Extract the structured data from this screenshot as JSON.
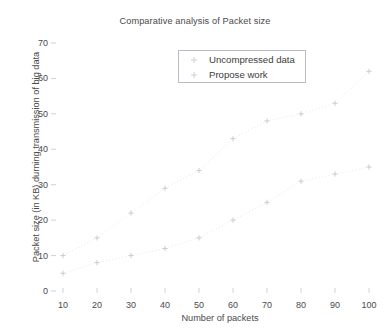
{
  "chart_data": {
    "type": "scatter",
    "title": "Comparative analysis of Packet size",
    "xlabel": "Number of packets",
    "ylabel": "Packet size (in KB) durning transmission of big data",
    "xlim": [
      5,
      104
    ],
    "ylim": [
      0,
      72
    ],
    "xticks": [
      10,
      20,
      30,
      40,
      50,
      60,
      70,
      80,
      90,
      100
    ],
    "yticks": [
      0,
      10,
      20,
      30,
      40,
      50,
      60,
      70
    ],
    "grid": false,
    "legend_position": "upper center",
    "marker": "plus",
    "marker_color": "#c9ccd3",
    "trendline": "dotted",
    "x": [
      10,
      20,
      30,
      40,
      50,
      60,
      70,
      80,
      90,
      100
    ],
    "series": [
      {
        "name": "Uncompressed data",
        "values": [
          10,
          15,
          22,
          29,
          34,
          43,
          48,
          50,
          53,
          62
        ]
      },
      {
        "name": "Propose work",
        "values": [
          5,
          8,
          10,
          12,
          15,
          20,
          25,
          31,
          33,
          35
        ]
      }
    ]
  },
  "axis": {
    "ytick_labels": [
      "70",
      "60",
      "50",
      "40",
      "30",
      "20",
      "10",
      "0"
    ],
    "xtick_labels": [
      "10",
      "20",
      "30",
      "40",
      "50",
      "60",
      "70",
      "80",
      "90",
      "100"
    ]
  },
  "legend": {
    "items": [
      {
        "label": "Uncompressed data"
      },
      {
        "label": "Propose work"
      }
    ]
  }
}
